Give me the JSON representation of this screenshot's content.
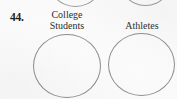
{
  "page": {
    "kind": "scanned-textbook-exercise-fragment",
    "background_color": "#fdfdfd",
    "width": 177,
    "height": 99
  },
  "exercise": {
    "number_label": "44.",
    "stroke_color": "#8d8d8d",
    "text_color": "#2a2a2a",
    "diagram_type": "two-separate-circles"
  },
  "sets": [
    {
      "id": "left",
      "label": "College\nStudents",
      "label_line1": "College",
      "label_line2": "Students",
      "contents": ""
    },
    {
      "id": "right",
      "label": "Athletes",
      "label_line1": "Athletes",
      "label_line2": "",
      "contents": ""
    }
  ],
  "partial_shapes": {
    "description": "bottoms of two circles from the exercise above, cropped by the page edge",
    "count": 2
  }
}
